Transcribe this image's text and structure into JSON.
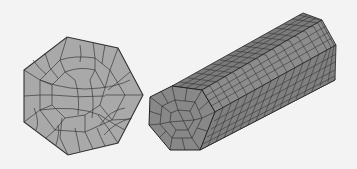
{
  "figure": {
    "background_color": "#f3f3f3",
    "panels": [
      {
        "id": "heptagon-2d-mesh",
        "type": "2D quad mesh",
        "shape": "heptagon",
        "fill_color": "#a9a9a9",
        "edge_color": "#3a3a3a",
        "vertices": [
          [
            67,
            37
          ],
          [
            118,
            48
          ],
          [
            143,
            95
          ],
          [
            118,
            143
          ],
          [
            68,
            155
          ],
          [
            24,
            122
          ],
          [
            24,
            70
          ]
        ]
      },
      {
        "id": "prism-3d-mesh",
        "type": "3D hex mesh",
        "shape": "extruded heptagonal prism",
        "front_face_color": "#8a8a8a",
        "top_face_color": "#7d7d7d",
        "side_face_color": "#6e6e6e",
        "edge_color": "#2a2a2a"
      }
    ]
  }
}
